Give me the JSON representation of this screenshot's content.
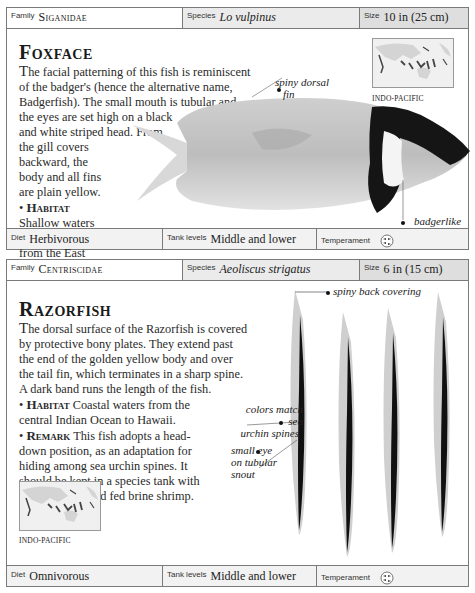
{
  "entries": [
    {
      "header": {
        "family_label": "Family",
        "family_value": "Siganidae",
        "species_label": "Species",
        "species_value": "Lo vulpinus",
        "size_label": "Size",
        "size_value": "10 in (25 cm)"
      },
      "title": "Foxface",
      "description": {
        "dropcap": "T",
        "lines": [
          "he facial patterning of this fish is reminiscent",
          "of the badger's (hence the alternative name,",
          "Badgerfish). The small mouth is tubular and",
          "the eyes are set high on a black",
          "and white striped head. From",
          "the gill covers",
          "backward, the",
          "body and all fins",
          "are plain yellow."
        ]
      },
      "habitat": {
        "bullet": "•",
        "label": "Habitat",
        "lines": [
          "Shallow waters",
          "among weeds",
          "from the East",
          "Indies to the",
          "Solomon Islands."
        ]
      },
      "map": {
        "label": "INDO-PACIFIC",
        "icon": "world-map-icon"
      },
      "annotations": {
        "dorsal_fin": [
          "spiny dorsal",
          "fin"
        ],
        "facial_marks": [
          "badgerlike",
          "facial marks"
        ]
      },
      "footer": {
        "diet_label": "Diet",
        "diet_value": "Herbivorous",
        "tank_label": "Tank levels",
        "tank_value": "Middle and lower",
        "temperament_label": "Temperament",
        "temperament_icon": "fish-group-icon"
      }
    },
    {
      "header": {
        "family_label": "Family",
        "family_value": "Centriscidae",
        "species_label": "Species",
        "species_value": "Aeoliscus strigatus",
        "size_label": "Size",
        "size_value": "6 in (15 cm)"
      },
      "title": "Razorfish",
      "description": {
        "dropcap": "T",
        "lines": [
          "he dorsal surface of the Razorfish is covered",
          "by protective bony plates. They extend past",
          "the end of the golden yellow body and over",
          "the tail fin, which terminates in a sharp spine.",
          "A dark band runs the length of the fish."
        ]
      },
      "habitat": {
        "bullet": "•",
        "label": "Habitat",
        "text1": " Coastal waters from the",
        "text2": "central Indian Ocean to Hawaii."
      },
      "remark": {
        "bullet": "•",
        "label": "Remark",
        "text1": " This fish adopts a head-",
        "lines": [
          "down position, as an adaptation for",
          "hiding among sea urchin spines. It",
          "should be kept in a species tank with",
          "invertebrates, and fed brine shrimp."
        ]
      },
      "map": {
        "label": "INDO-PACIFIC",
        "icon": "world-map-icon"
      },
      "annotations": {
        "back_covering": "spiny back covering",
        "colors": [
          "colors match sea",
          "urchin spines"
        ],
        "eye": [
          "small eye",
          "on tubular",
          "snout"
        ]
      },
      "footer": {
        "diet_label": "Diet",
        "diet_value": "Omnivorous",
        "tank_label": "Tank levels",
        "tank_value": "Middle and lower",
        "temperament_label": "Temperament",
        "temperament_icon": "fish-group-icon"
      }
    }
  ]
}
